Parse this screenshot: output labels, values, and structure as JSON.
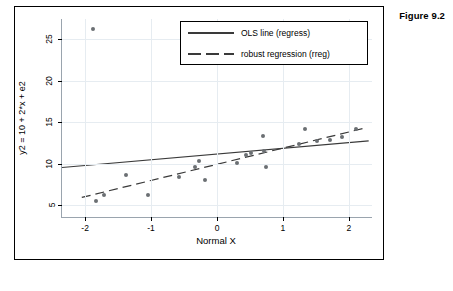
{
  "figure": {
    "caption": "Figure 9.2"
  },
  "chart_data": {
    "type": "scatter",
    "title": "",
    "xlabel": "Normal X",
    "ylabel": "y2 = 10 + 2*x + e2",
    "xlim": [
      -2.35,
      2.35
    ],
    "ylim": [
      3.6,
      27.4
    ],
    "xticks": [
      -2,
      -1,
      0,
      1,
      2
    ],
    "xticklabels": [
      "-2",
      "-1",
      "0",
      "1",
      "2"
    ],
    "yticks": [
      5,
      10,
      15,
      20,
      25
    ],
    "yticklabels": [
      "5",
      "10",
      "15",
      "20",
      "25"
    ],
    "grid": true,
    "grid_color": "#e6ecf1",
    "point_color": "#6b6f73",
    "line_color": "#3a3a3a",
    "points": [
      {
        "x": -1.88,
        "y": 26.2
      },
      {
        "x": -1.83,
        "y": 5.5
      },
      {
        "x": -1.72,
        "y": 6.3
      },
      {
        "x": -1.38,
        "y": 8.6
      },
      {
        "x": -1.05,
        "y": 6.2
      },
      {
        "x": -0.58,
        "y": 8.4
      },
      {
        "x": -0.33,
        "y": 9.6
      },
      {
        "x": -0.28,
        "y": 10.3
      },
      {
        "x": -0.18,
        "y": 8.0
      },
      {
        "x": 0.3,
        "y": 10.1
      },
      {
        "x": 0.44,
        "y": 11.1
      },
      {
        "x": 0.52,
        "y": 11.3
      },
      {
        "x": 0.7,
        "y": 13.3
      },
      {
        "x": 0.72,
        "y": 11.5
      },
      {
        "x": 0.75,
        "y": 9.6
      },
      {
        "x": 1.25,
        "y": 12.4
      },
      {
        "x": 1.33,
        "y": 14.2
      },
      {
        "x": 1.52,
        "y": 12.7
      },
      {
        "x": 1.72,
        "y": 12.8
      },
      {
        "x": 1.9,
        "y": 13.2
      },
      {
        "x": 2.1,
        "y": 14.2
      }
    ],
    "series": [
      {
        "name": "OLS line (regress)",
        "type": "line",
        "style": "solid",
        "x": [
          -2.35,
          2.3
        ],
        "y": [
          9.55,
          12.75
        ]
      },
      {
        "name": "robust regression (rreg)",
        "type": "line",
        "style": "dashed",
        "x": [
          -2.05,
          2.22
        ],
        "y": [
          5.95,
          14.25
        ]
      }
    ],
    "legend": {
      "position": "top-center-right",
      "entries": [
        {
          "label": "OLS line (regress)",
          "style": "solid"
        },
        {
          "label": "robust regression (rreg)",
          "style": "dashed"
        }
      ]
    }
  }
}
